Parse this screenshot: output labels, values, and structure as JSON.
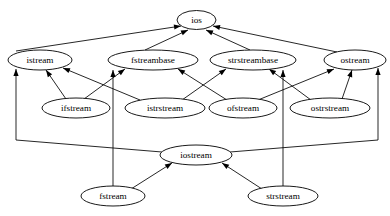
{
  "diagram": {
    "type": "inheritance-graph",
    "edge_style": "directed-arrow",
    "colors": {
      "background": "#ffffff",
      "node_fill": "#ffffff",
      "stroke": "#000000",
      "text": "#000000"
    },
    "nodes": [
      {
        "id": "ios",
        "label": "ios",
        "cx": 196.5,
        "cy": 20,
        "rx": 19.5,
        "ry": 9.5
      },
      {
        "id": "istream",
        "label": "istream",
        "cx": 40,
        "cy": 60,
        "rx": 32,
        "ry": 10
      },
      {
        "id": "fstreambase",
        "label": "fstreambase",
        "cx": 153,
        "cy": 60,
        "rx": 45,
        "ry": 10
      },
      {
        "id": "strstreambase",
        "label": "strstreambase",
        "cx": 253,
        "cy": 60,
        "rx": 43,
        "ry": 10
      },
      {
        "id": "ostream",
        "label": "ostream",
        "cx": 355,
        "cy": 60,
        "rx": 31,
        "ry": 10
      },
      {
        "id": "ifstream",
        "label": "ifstream",
        "cx": 76,
        "cy": 108,
        "rx": 34,
        "ry": 10
      },
      {
        "id": "istrstream",
        "label": "istrstream",
        "cx": 165,
        "cy": 108,
        "rx": 40,
        "ry": 10
      },
      {
        "id": "ofstream",
        "label": "ofstream",
        "cx": 243,
        "cy": 108,
        "rx": 34,
        "ry": 10
      },
      {
        "id": "ostrstream",
        "label": "ostrstream",
        "cx": 330,
        "cy": 108,
        "rx": 40,
        "ry": 10
      },
      {
        "id": "iostream",
        "label": "iostream",
        "cx": 196,
        "cy": 155,
        "rx": 36,
        "ry": 10
      },
      {
        "id": "fstream",
        "label": "fstream",
        "cx": 113,
        "cy": 196,
        "rx": 32,
        "ry": 10
      },
      {
        "id": "strstream",
        "label": "strstream",
        "cx": 283,
        "cy": 196,
        "rx": 35,
        "ry": 10
      }
    ],
    "edges": [
      {
        "from": "istream",
        "to": "ios",
        "points": "16,51 181,26"
      },
      {
        "from": "fstreambase",
        "to": "ios",
        "points": "145,50 188,30"
      },
      {
        "from": "strstreambase",
        "to": "ios",
        "points": "250,50 206,30"
      },
      {
        "from": "ostream",
        "to": "ios",
        "points": "337,52 213,26"
      },
      {
        "from": "ifstream",
        "to": "istream",
        "points": "66,99 46,70"
      },
      {
        "from": "istrstream",
        "to": "istream",
        "points": "140,100 63,68"
      },
      {
        "from": "iostream",
        "to": "istream",
        "points": "162,152 16,140 16,69"
      },
      {
        "from": "ifstream",
        "to": "fstreambase",
        "points": "84,99 125,69"
      },
      {
        "from": "fstream",
        "to": "fstreambase",
        "points": "113,187 113,140 113,70"
      },
      {
        "from": "ofstream",
        "to": "fstreambase",
        "points": "227,100 178,69"
      },
      {
        "from": "istrstream",
        "to": "strstreambase",
        "points": "182,100 226,69"
      },
      {
        "from": "strstream",
        "to": "strstreambase",
        "points": "283,187 283,140 283,70"
      },
      {
        "from": "ostrstream",
        "to": "strstreambase",
        "points": "311,100 269,69"
      },
      {
        "from": "ofstream",
        "to": "ostream",
        "points": "258,100 334,69"
      },
      {
        "from": "ostrstream",
        "to": "ostream",
        "points": "342,99 352,70"
      },
      {
        "from": "iostream",
        "to": "ostream",
        "points": "230,152 378,140 378,68"
      },
      {
        "from": "fstream",
        "to": "iostream",
        "points": "131,189 172,163"
      },
      {
        "from": "strstream",
        "to": "iostream",
        "points": "262,189 222,163"
      }
    ]
  }
}
